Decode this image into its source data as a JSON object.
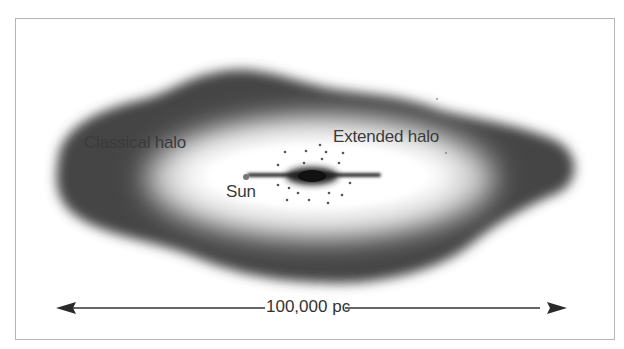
{
  "diagram": {
    "type": "galaxy halo schematic",
    "labels": {
      "classical_halo": "Classical halo",
      "extended_halo": "Extended halo",
      "sun": "Sun"
    },
    "scale_bar": {
      "label": "100,000 pc"
    },
    "colors": {
      "halo_dark": "#3c3c3c",
      "inner_glow": "#ffffff",
      "disk": "#2a2a2a",
      "frame": "#b5b5b5"
    }
  }
}
